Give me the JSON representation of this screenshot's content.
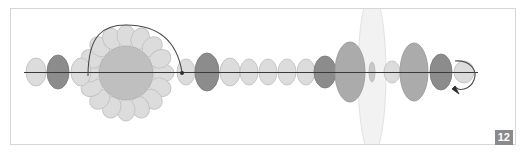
{
  "figure": {
    "badge_label": "12",
    "background_color": "#ffffff",
    "frame_border_color": "#d6d6d6",
    "badge_background_color": "#8a8a8a",
    "badge_text_color": "#ffffff"
  },
  "palette": {
    "light_blob": "#d9d9d9",
    "light_blob_stroke": "#bcbcbc",
    "dark_blob": "#8c8c8c",
    "dark_blob_stroke": "#7a7a7a",
    "mid_blob": "#b5b5b5",
    "mid_blob_stroke": "#a0a0a0",
    "core_circle": "#bdbdbd",
    "core_circle_stroke": "#b0b0b0",
    "lens_fill": "#f2f2f2",
    "lens_stroke": "#e0e0e0",
    "axis_line": "#3a3a3a",
    "curve_line": "#4a4a4a"
  },
  "diagram": {
    "axis": {
      "name": "horizontal-axis",
      "y": 72,
      "x_start": 24,
      "x_end": 478
    },
    "left_chain": [
      {
        "id": "blob-l1",
        "cx": 36,
        "cy": 72,
        "rx": 10,
        "ry": 14,
        "shade": "light"
      },
      {
        "id": "blob-l2",
        "cx": 58,
        "cy": 72,
        "rx": 11,
        "ry": 17,
        "shade": "dark"
      },
      {
        "id": "blob-l3",
        "cx": 81,
        "cy": 72,
        "rx": 10,
        "ry": 14,
        "shade": "light"
      }
    ],
    "rosette": {
      "name": "radial-rosette",
      "center_x": 126,
      "center_y": 73,
      "core_radius": 27,
      "petal_count": 16,
      "petal_orbit_radius": 37,
      "petal_rx": 11,
      "petal_ry": 9
    },
    "arc": {
      "name": "overhead-arc-path",
      "start_x": 88,
      "start_y": 74,
      "end_x": 182,
      "end_y": 73,
      "peak_y": 28
    },
    "mid_chain": [
      {
        "id": "blob-m1",
        "cx": 186,
        "cy": 72,
        "rx": 9,
        "ry": 13,
        "shade": "light"
      },
      {
        "id": "blob-m2",
        "cx": 207,
        "cy": 72,
        "rx": 12,
        "ry": 19,
        "shade": "dark"
      },
      {
        "id": "blob-m3",
        "cx": 230,
        "cy": 72,
        "rx": 10,
        "ry": 14,
        "shade": "light"
      },
      {
        "id": "blob-m4",
        "cx": 249,
        "cy": 72,
        "rx": 9,
        "ry": 13,
        "shade": "light"
      },
      {
        "id": "blob-m5",
        "cx": 268,
        "cy": 72,
        "rx": 9,
        "ry": 13,
        "shade": "light"
      },
      {
        "id": "blob-m6",
        "cx": 287,
        "cy": 72,
        "rx": 9,
        "ry": 13,
        "shade": "light"
      },
      {
        "id": "blob-m7",
        "cx": 306,
        "cy": 72,
        "rx": 9,
        "ry": 13,
        "shade": "light"
      },
      {
        "id": "blob-m8",
        "cx": 325,
        "cy": 72,
        "rx": 11,
        "ry": 16,
        "shade": "dark"
      },
      {
        "id": "blob-m9",
        "cx": 350,
        "cy": 72,
        "rx": 15,
        "ry": 30,
        "shade": "mid"
      }
    ],
    "lens": {
      "name": "lens-ellipse",
      "cx": 372,
      "cy": 74,
      "rx": 14,
      "ry": 82
    },
    "right_chain": [
      {
        "id": "blob-r0",
        "cx": 372,
        "cy": 72,
        "rx": 3,
        "ry": 10,
        "shade": "mid"
      },
      {
        "id": "blob-r1",
        "cx": 392,
        "cy": 72,
        "rx": 8,
        "ry": 11,
        "shade": "light"
      },
      {
        "id": "blob-r2",
        "cx": 414,
        "cy": 72,
        "rx": 14,
        "ry": 29,
        "shade": "mid"
      },
      {
        "id": "blob-r3",
        "cx": 441,
        "cy": 72,
        "rx": 11,
        "ry": 18,
        "shade": "dark"
      },
      {
        "id": "blob-r4",
        "cx": 464,
        "cy": 72,
        "rx": 10,
        "ry": 11,
        "shade": "light"
      }
    ],
    "loop_arrow": {
      "name": "curved-loop-arrow",
      "start_x": 455,
      "start_y": 62,
      "tip_x": 459,
      "tip_y": 94
    }
  }
}
